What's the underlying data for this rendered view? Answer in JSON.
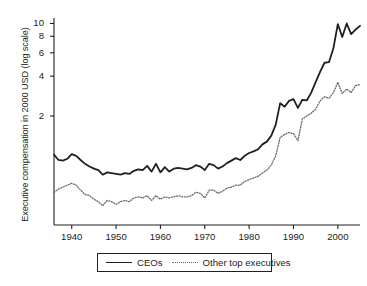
{
  "chart_data": {
    "type": "line",
    "title": "",
    "xlabel": "",
    "ylabel": "Executive compensation in 2000 USD (log scale)",
    "yscale": "log",
    "xlim": [
      1936,
      2005
    ],
    "ylim": [
      0.3,
      11
    ],
    "grid": false,
    "legend_position": "bottom-center",
    "yticks": [
      2,
      4,
      6,
      8,
      10
    ],
    "ytick_labels": [
      "2",
      "4",
      "6",
      "8",
      "10"
    ],
    "xticks": [
      1940,
      1950,
      1960,
      1970,
      1980,
      1990,
      2000
    ],
    "xtick_labels": [
      "1940",
      "1950",
      "1960",
      "1970",
      "1980",
      "1990",
      "2000"
    ],
    "x": [
      1936,
      1937,
      1938,
      1939,
      1940,
      1941,
      1942,
      1943,
      1944,
      1945,
      1946,
      1947,
      1948,
      1949,
      1950,
      1951,
      1952,
      1953,
      1954,
      1955,
      1956,
      1957,
      1958,
      1959,
      1960,
      1961,
      1962,
      1963,
      1964,
      1965,
      1966,
      1967,
      1968,
      1969,
      1970,
      1971,
      1972,
      1973,
      1974,
      1975,
      1976,
      1977,
      1978,
      1979,
      1980,
      1981,
      1982,
      1983,
      1984,
      1985,
      1986,
      1987,
      1988,
      1989,
      1990,
      1991,
      1992,
      1993,
      1994,
      1995,
      1996,
      1997,
      1998,
      1999,
      2000,
      2001,
      2002,
      2003,
      2004,
      2005
    ],
    "series": [
      {
        "name": "CEOs",
        "style": "solid",
        "color": "#231f20",
        "values": [
          1.02,
          0.93,
          0.92,
          0.95,
          1.03,
          1.0,
          0.93,
          0.87,
          0.83,
          0.8,
          0.78,
          0.72,
          0.75,
          0.74,
          0.73,
          0.72,
          0.74,
          0.73,
          0.77,
          0.79,
          0.78,
          0.84,
          0.76,
          0.87,
          0.75,
          0.82,
          0.76,
          0.8,
          0.81,
          0.8,
          0.79,
          0.81,
          0.85,
          0.83,
          0.78,
          0.87,
          0.85,
          0.8,
          0.83,
          0.88,
          0.92,
          0.96,
          0.93,
          1.0,
          1.05,
          1.08,
          1.12,
          1.22,
          1.28,
          1.42,
          1.72,
          2.5,
          2.35,
          2.6,
          2.68,
          2.3,
          2.65,
          2.62,
          3.0,
          3.6,
          4.3,
          5.05,
          5.1,
          6.5,
          9.9,
          7.9,
          10.0,
          8.3,
          9.0,
          9.6
        ]
      },
      {
        "name": "Other top executives",
        "style": "dotted",
        "color": "#6d6a6b",
        "values": [
          0.53,
          0.56,
          0.58,
          0.6,
          0.62,
          0.6,
          0.55,
          0.51,
          0.5,
          0.47,
          0.45,
          0.42,
          0.46,
          0.45,
          0.43,
          0.45,
          0.46,
          0.45,
          0.48,
          0.49,
          0.48,
          0.5,
          0.46,
          0.5,
          0.47,
          0.49,
          0.48,
          0.49,
          0.5,
          0.49,
          0.49,
          0.5,
          0.53,
          0.52,
          0.48,
          0.55,
          0.55,
          0.52,
          0.54,
          0.57,
          0.58,
          0.6,
          0.6,
          0.64,
          0.66,
          0.68,
          0.7,
          0.74,
          0.78,
          0.85,
          1.0,
          1.38,
          1.45,
          1.5,
          1.47,
          1.3,
          1.9,
          2.0,
          2.1,
          2.25,
          2.6,
          2.8,
          2.72,
          3.0,
          3.6,
          2.95,
          3.2,
          3.0,
          3.4,
          3.45
        ]
      }
    ]
  },
  "legend": {
    "items": [
      {
        "label": "CEOs",
        "style": "solid"
      },
      {
        "label": "Other top executives",
        "style": "dotted"
      }
    ]
  }
}
